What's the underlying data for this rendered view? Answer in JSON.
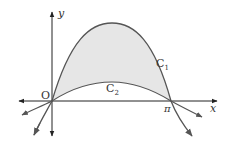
{
  "diagram": {
    "axes": {
      "x_label": "x",
      "y_label": "y",
      "origin_label": "O",
      "x_tick_label": "π"
    },
    "curves": [
      {
        "name": "C1",
        "label_main": "C",
        "label_sub": "1",
        "shape": "tall arch through O and π"
      },
      {
        "name": "C2",
        "label_main": "C",
        "label_sub": "2",
        "shape": "low arch through O and π"
      }
    ],
    "shaded_region": "between C1 and C2 from O to π",
    "colors": {
      "axis": "#222222",
      "curve": "#555555",
      "shade": "#e6e6e6",
      "text": "#333333"
    }
  }
}
